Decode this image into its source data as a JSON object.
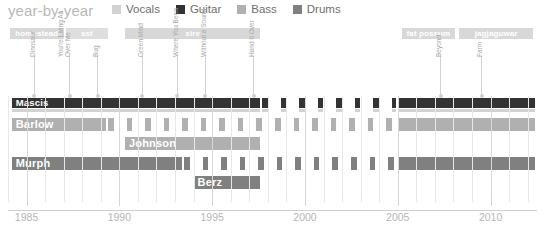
{
  "header": {
    "title": "year-by-year",
    "legend": [
      {
        "label": "Vocals",
        "color": "#d2d2d2"
      },
      {
        "label": "Guitar",
        "color": "#333333"
      },
      {
        "label": "Bass",
        "color": "#b0b0b0"
      },
      {
        "label": "Drums",
        "color": "#808080"
      }
    ]
  },
  "axis": {
    "x_min": 1984,
    "x_max": 2012.5,
    "major_ticks": [
      1985,
      1990,
      1995,
      2000,
      2005,
      2010
    ],
    "major_tick_labels": [
      "1985",
      "1990",
      "1995",
      "2000",
      "2005",
      "2010"
    ],
    "minor_tick_step": 1
  },
  "record_labels": [
    {
      "name": "homestead",
      "start": 1984.1,
      "end": 1987.0,
      "color": "#d8d8d8"
    },
    {
      "name": "sst",
      "start": 1987.1,
      "end": 1989.4,
      "color": "#dedede"
    },
    {
      "name": "sire",
      "start": 1990.3,
      "end": 1997.6,
      "color": "#d8d8d8"
    },
    {
      "name": "fat possum",
      "start": 2005.2,
      "end": 2008.1,
      "color": "#d8d8d8"
    },
    {
      "name": "jagjaguwar",
      "start": 2008.3,
      "end": 2012.3,
      "color": "#d8d8d8"
    }
  ],
  "albums": [
    {
      "name": "Dinosaur",
      "year": 1985.4,
      "stem": 40
    },
    {
      "name": "You're Living All\nOver Me",
      "year": 1987.3,
      "stem": 40
    },
    {
      "name": "Bug",
      "year": 1988.8,
      "stem": 40
    },
    {
      "name": "Green Mind",
      "year": 1991.2,
      "stem": 40
    },
    {
      "name": "Where You Been",
      "year": 1993.1,
      "stem": 40
    },
    {
      "name": "Without a Sound",
      "year": 1994.6,
      "stem": 40
    },
    {
      "name": "Hand It Over",
      "year": 1997.2,
      "stem": 40
    },
    {
      "name": "Beyond",
      "year": 2007.3,
      "stem": 40
    },
    {
      "name": "Farm",
      "year": 2009.5,
      "stem": 40
    }
  ],
  "chart_data": {
    "type": "bar",
    "title": "year-by-year",
    "xlabel": "",
    "ylabel": "",
    "xlim": [
      1984,
      2012.5
    ],
    "grid": true,
    "legend_position": "top",
    "members": [
      {
        "name": "Mascis",
        "label_inside": true,
        "roles": [
          {
            "instrument": "Guitar",
            "color": "#333333",
            "top": 2,
            "height": 10,
            "segments": [
              {
                "start": 1984.2,
                "end": 1997.6,
                "style": "solid"
              },
              {
                "start": 1997.7,
                "end": 2004.9,
                "style": "hatched"
              },
              {
                "start": 2005.0,
                "end": 2012.4,
                "style": "solid"
              }
            ]
          },
          {
            "instrument": "Vocals",
            "color": "#d2d2d2",
            "top": 13,
            "height": 3,
            "segments": [
              {
                "start": 1984.2,
                "end": 1997.6,
                "style": "solid"
              },
              {
                "start": 1997.7,
                "end": 2004.9,
                "style": "hatched"
              },
              {
                "start": 2005.0,
                "end": 2012.4,
                "style": "solid"
              }
            ]
          }
        ]
      },
      {
        "name": "Barlow",
        "label_inside": true,
        "roles": [
          {
            "instrument": "Bass",
            "color": "#b0b0b0",
            "top": 22,
            "height": 13,
            "segments": [
              {
                "start": 1984.2,
                "end": 1989.3,
                "style": "solid"
              },
              {
                "start": 1989.4,
                "end": 2004.9,
                "style": "hatched"
              },
              {
                "start": 2005.0,
                "end": 2012.4,
                "style": "solid"
              }
            ]
          }
        ]
      },
      {
        "name": "Johnson",
        "label_inside": true,
        "roles": [
          {
            "instrument": "Bass",
            "color": "#b0b0b0",
            "top": 41,
            "height": 13,
            "segments": [
              {
                "start": 1990.3,
                "end": 1997.6,
                "style": "solid"
              }
            ]
          }
        ]
      },
      {
        "name": "Murph",
        "label_inside": true,
        "roles": [
          {
            "instrument": "Drums",
            "color": "#808080",
            "top": 61,
            "height": 13,
            "segments": [
              {
                "start": 1984.2,
                "end": 1993.4,
                "style": "solid"
              },
              {
                "start": 1993.5,
                "end": 2004.9,
                "style": "hatched"
              },
              {
                "start": 2005.0,
                "end": 2012.4,
                "style": "solid"
              }
            ]
          }
        ]
      },
      {
        "name": "Berz",
        "label_inside": true,
        "roles": [
          {
            "instrument": "Drums",
            "color": "#808080",
            "top": 80,
            "height": 13,
            "segments": [
              {
                "start": 1994.0,
                "end": 1997.6,
                "style": "solid"
              }
            ]
          }
        ]
      }
    ]
  }
}
